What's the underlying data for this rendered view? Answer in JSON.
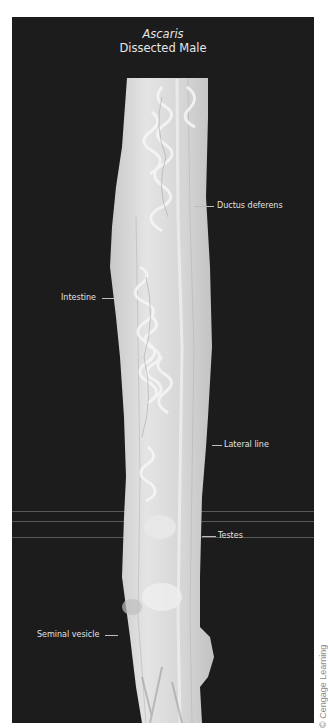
{
  "figure": {
    "title_genus": "Ascaris",
    "title_sub": "Dissected Male",
    "background_color": "#1c1c1c",
    "specimen_color": "#d9d9d9"
  },
  "labels": [
    {
      "id": "ductus-deferens",
      "text": "Ductus deferens",
      "side": "right"
    },
    {
      "id": "intestine",
      "text": "Intestine",
      "side": "left"
    },
    {
      "id": "lateral-line",
      "text": "Lateral line",
      "side": "right"
    },
    {
      "id": "testes",
      "text": "Testes",
      "side": "right"
    },
    {
      "id": "seminal-vesicle",
      "text": "Seminal vesicle",
      "side": "left"
    }
  ],
  "credit": "© Cengage Learning"
}
